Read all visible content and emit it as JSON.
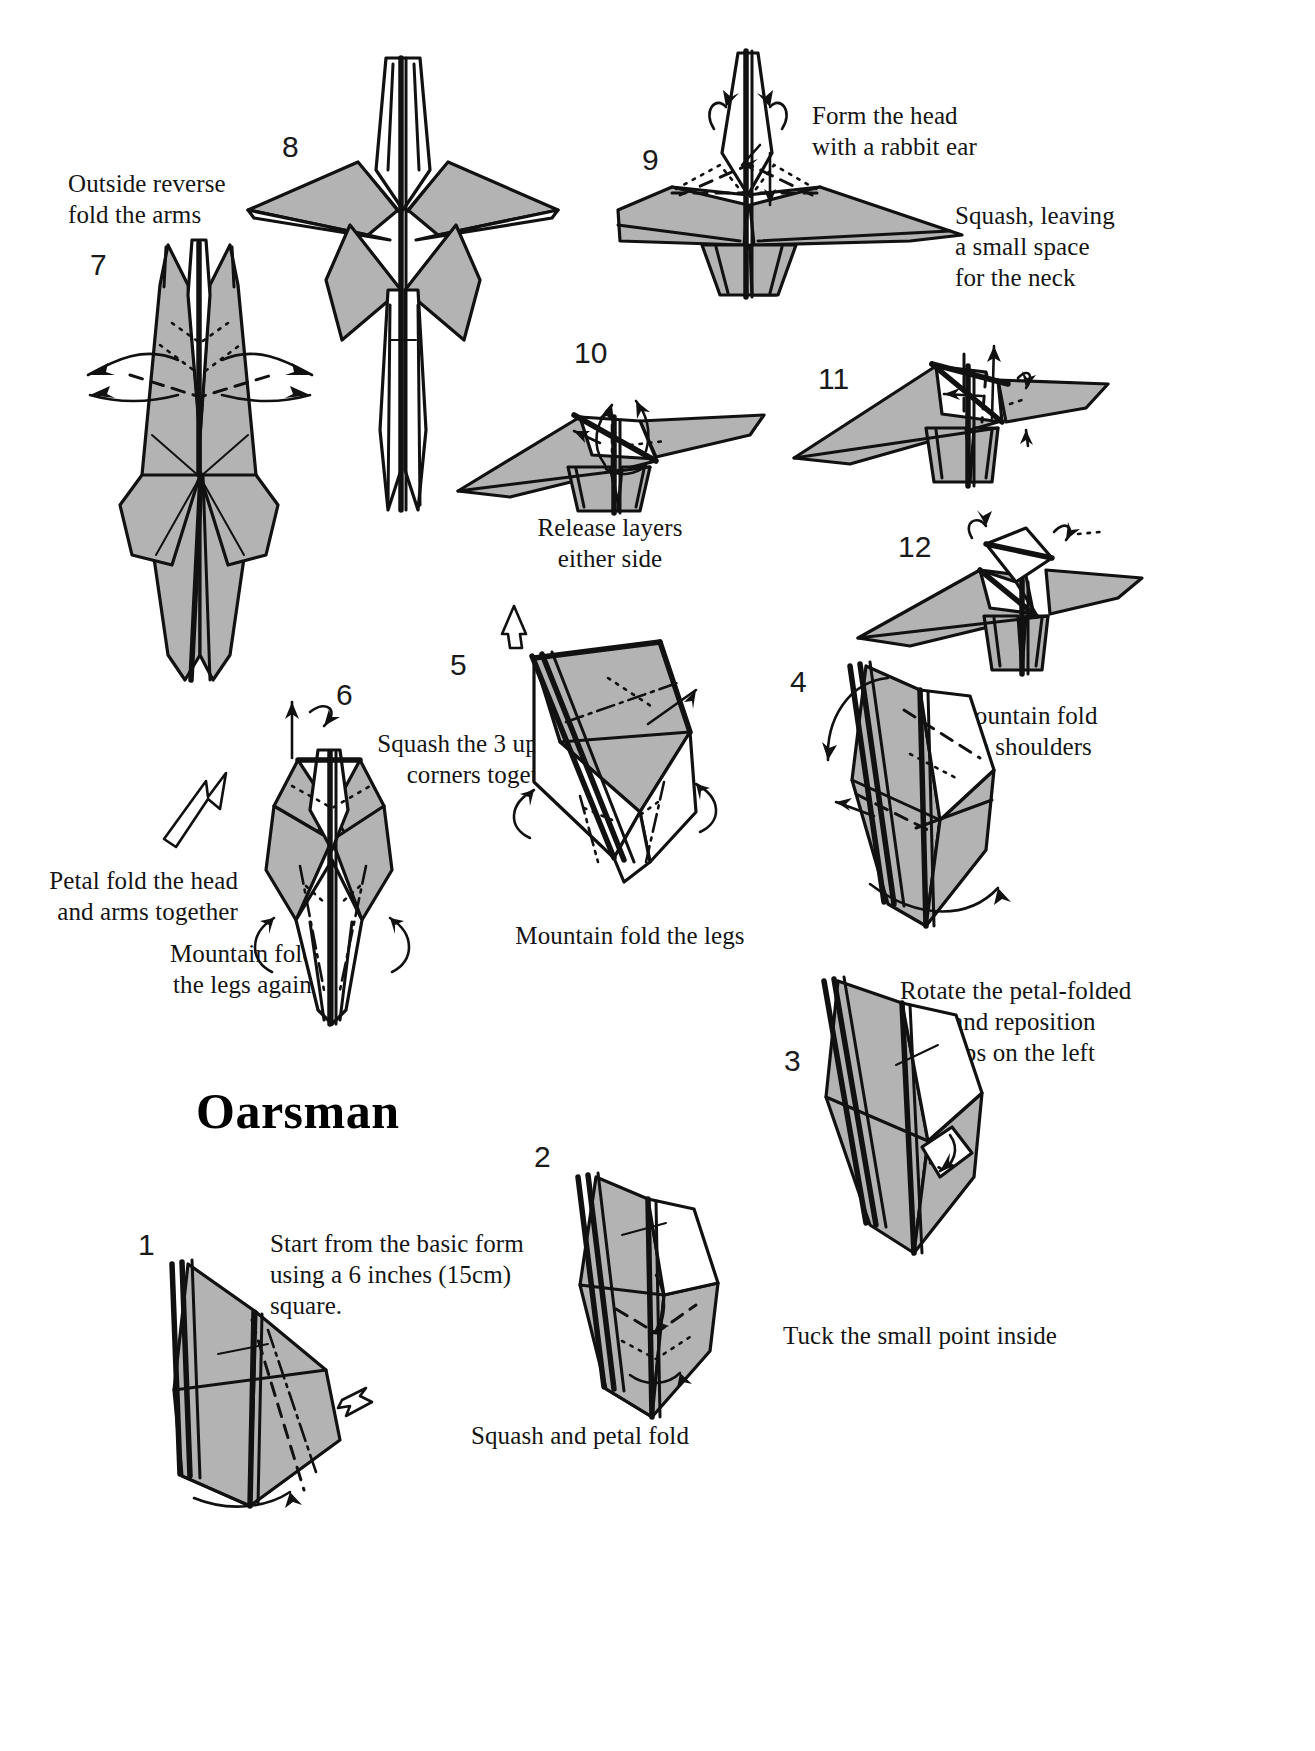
{
  "document": {
    "title": "Oarsman",
    "type": "origami-folding-instructions"
  },
  "steps": [
    {
      "number": "1",
      "caption": "Start from the basic form\nusing a 6 inches (15cm)\nsquare."
    },
    {
      "number": "2",
      "caption": "Squash and petal fold"
    },
    {
      "number": "3",
      "caption": "Tuck the small point inside"
    },
    {
      "number": "4",
      "caption": "Rotate the petal-folded\nflap, and reposition\nthe flaps on the left"
    },
    {
      "number": "5",
      "caption": "Mountain fold the legs",
      "caption_secondary": "Squash the 3 upper\ncorners together"
    },
    {
      "number": "6",
      "caption": "Mountain fold\nthe legs again",
      "caption_secondary": "Petal fold the head\nand arms together"
    },
    {
      "number": "7",
      "caption": "Outside reverse\nfold the arms"
    },
    {
      "number": "8",
      "caption": ""
    },
    {
      "number": "9",
      "caption": "Form the head\nwith a rabbit ear",
      "caption_secondary": "Squash, leaving\na small space\nfor the neck"
    },
    {
      "number": "10",
      "caption": "Release layers\neither side"
    },
    {
      "number": "11",
      "caption": ""
    },
    {
      "number": "12",
      "caption": "Mountain fold\nthe shoulders"
    }
  ],
  "colors": {
    "paper_shaded": "#b3b3b3",
    "paper_white": "#ffffff",
    "ink": "#111111",
    "background": "#ffffff"
  }
}
